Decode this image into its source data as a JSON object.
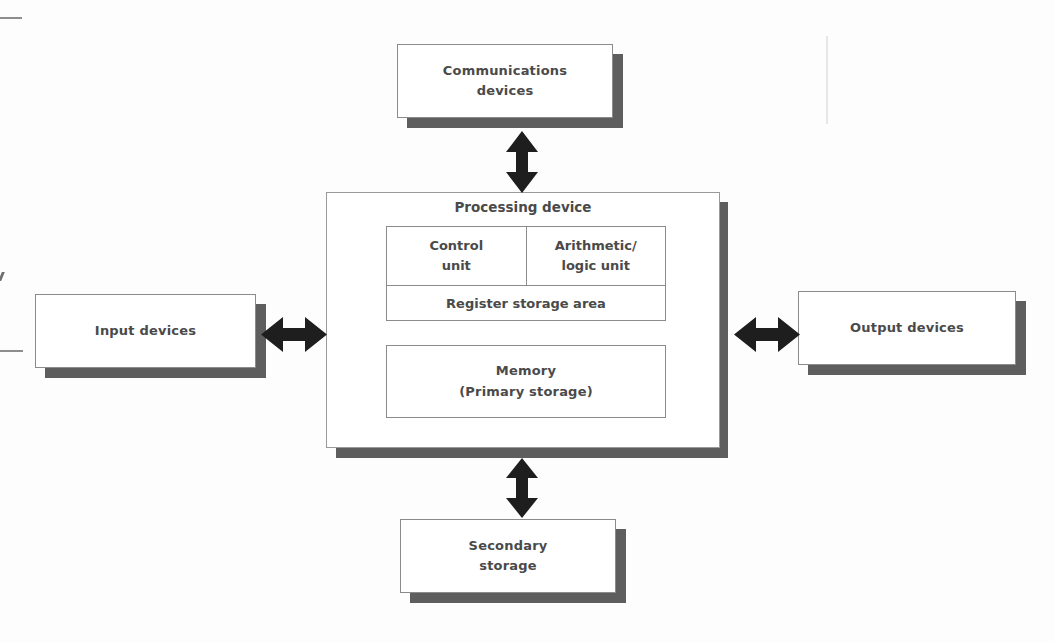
{
  "diagram": {
    "text_color": "#4a4a4a",
    "box_border_color": "#8b8b8b",
    "shadow_color": "#5e5e5e",
    "background": "#ffffff",
    "boxes": {
      "communications": {
        "line1": "Communications",
        "line2": "devices"
      },
      "input": {
        "line1": "Input devices",
        "line2": ""
      },
      "output": {
        "line1": "Output devices",
        "line2": ""
      },
      "secondary": {
        "line1": "Secondary",
        "line2": "storage"
      },
      "memory": {
        "line1": "Memory",
        "line2": "(Primary storage)"
      },
      "processing": {
        "label": "Processing device"
      },
      "control_unit": {
        "line1": "Control",
        "line2": "unit"
      },
      "alu": {
        "line1": "Arithmetic/",
        "line2": "logic unit"
      },
      "register": {
        "label": "Register storage area"
      }
    },
    "arrows": {
      "top": {
        "name": "communications-link-arrow",
        "direction": "bidirectional-vertical"
      },
      "bottom": {
        "name": "secondary-storage-link-arrow",
        "direction": "bidirectional-vertical"
      },
      "left": {
        "name": "input-link-arrow",
        "direction": "bidirectional-horizontal"
      },
      "right": {
        "name": "output-link-arrow",
        "direction": "bidirectional-horizontal"
      }
    }
  }
}
